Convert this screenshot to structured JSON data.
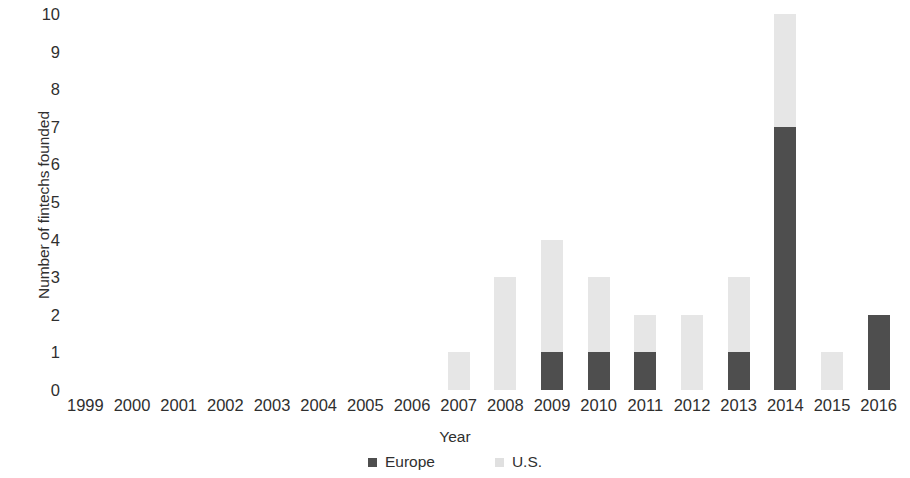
{
  "chart_data": {
    "type": "bar",
    "subtype": "stacked-bar",
    "title": "",
    "xlabel": "Year",
    "ylabel": "Number of fintechs founded",
    "ylim": [
      0,
      10
    ],
    "ytick_step": 1,
    "yticks": [
      "10",
      "9",
      "8",
      "7",
      "6",
      "5",
      "4",
      "3",
      "2",
      "1",
      "0"
    ],
    "grid": false,
    "legend_position": "bottom",
    "categories": [
      "1999",
      "2000",
      "2001",
      "2002",
      "2003",
      "2004",
      "2005",
      "2006",
      "2007",
      "2008",
      "2009",
      "2010",
      "2011",
      "2012",
      "2013",
      "2014",
      "2015",
      "2016"
    ],
    "series": [
      {
        "name": "Europe",
        "color": "#4e4e4e",
        "values": [
          0,
          0,
          0,
          0,
          0,
          0,
          0,
          0,
          0,
          0,
          1,
          1,
          1,
          0,
          1,
          7,
          0,
          2
        ]
      },
      {
        "name": "U.S.",
        "color": "#e6e6e6",
        "values": [
          0,
          0,
          0,
          0,
          0,
          0,
          0,
          0,
          1,
          3,
          3,
          2,
          1,
          2,
          2,
          3,
          1,
          0
        ]
      }
    ],
    "totals": [
      0,
      0,
      0,
      0,
      0,
      0,
      0,
      0,
      1,
      3,
      4,
      3,
      2,
      2,
      3,
      10,
      1,
      2
    ]
  },
  "legend": {
    "items": [
      {
        "label": "Europe",
        "color": "#4e4e4e"
      },
      {
        "label": "U.S.",
        "color": "#e0e0e0"
      }
    ]
  }
}
